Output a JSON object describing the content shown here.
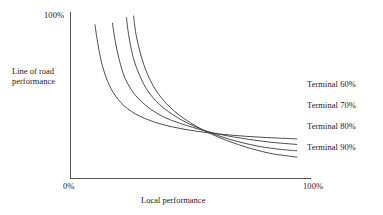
{
  "chart_data": {
    "type": "line",
    "title": "",
    "subtitle": "",
    "xlabel": "Local performance",
    "ylabel": "Line of road performance",
    "xlim": [
      0,
      100
    ],
    "ylim": [
      0,
      100
    ],
    "xticks": [
      "0%",
      "100%"
    ],
    "yticks": [
      "100%"
    ],
    "grid": false,
    "legend_position": "right-inline",
    "annotation": "Four convex trade-off (isoquant) curves: higher terminal performance requires a worse trade-off between local and line-of-road performance.",
    "series": [
      {
        "name": "Terminal 60%",
        "label": "Terminal 60%",
        "color": "#3a3a3a",
        "points": [
          {
            "x": 10.4,
            "y": 97.0
          },
          {
            "x": 11.5,
            "y": 86.0
          },
          {
            "x": 13.0,
            "y": 74.0
          },
          {
            "x": 15.5,
            "y": 62.0
          },
          {
            "x": 19.0,
            "y": 52.0
          },
          {
            "x": 24.0,
            "y": 44.0
          },
          {
            "x": 31.0,
            "y": 38.0
          },
          {
            "x": 40.0,
            "y": 33.5
          },
          {
            "x": 52.0,
            "y": 30.0
          },
          {
            "x": 66.0,
            "y": 27.5
          },
          {
            "x": 80.0,
            "y": 26.0
          },
          {
            "x": 94.5,
            "y": 25.0
          }
        ]
      },
      {
        "name": "Terminal 70%",
        "label": "Terminal 70%",
        "color": "#3a3a3a",
        "points": [
          {
            "x": 17.7,
            "y": 98.0
          },
          {
            "x": 18.8,
            "y": 87.0
          },
          {
            "x": 20.5,
            "y": 75.0
          },
          {
            "x": 23.0,
            "y": 63.0
          },
          {
            "x": 27.0,
            "y": 53.0
          },
          {
            "x": 32.5,
            "y": 45.0
          },
          {
            "x": 39.5,
            "y": 38.5
          },
          {
            "x": 48.5,
            "y": 33.5
          },
          {
            "x": 59.0,
            "y": 29.0
          },
          {
            "x": 71.0,
            "y": 25.5
          },
          {
            "x": 83.0,
            "y": 23.0
          },
          {
            "x": 94.5,
            "y": 21.5
          }
        ]
      },
      {
        "name": "Terminal 80%",
        "label": "Terminal 80%",
        "color": "#3a3a3a",
        "points": [
          {
            "x": 23.5,
            "y": 101.5
          },
          {
            "x": 24.5,
            "y": 90.0
          },
          {
            "x": 26.2,
            "y": 77.0
          },
          {
            "x": 29.0,
            "y": 65.0
          },
          {
            "x": 33.0,
            "y": 54.0
          },
          {
            "x": 39.0,
            "y": 44.5
          },
          {
            "x": 47.0,
            "y": 36.5
          },
          {
            "x": 56.5,
            "y": 30.0
          },
          {
            "x": 67.0,
            "y": 24.5
          },
          {
            "x": 78.0,
            "y": 20.5
          },
          {
            "x": 87.0,
            "y": 18.5
          },
          {
            "x": 94.5,
            "y": 17.5
          }
        ]
      },
      {
        "name": "Terminal 90%",
        "label": "Terminal 90%",
        "color": "#3a3a3a",
        "points": [
          {
            "x": 26.5,
            "y": 102.5
          },
          {
            "x": 27.5,
            "y": 91.0
          },
          {
            "x": 29.5,
            "y": 78.0
          },
          {
            "x": 32.5,
            "y": 65.0
          },
          {
            "x": 37.0,
            "y": 53.0
          },
          {
            "x": 43.5,
            "y": 42.5
          },
          {
            "x": 52.0,
            "y": 33.5
          },
          {
            "x": 62.0,
            "y": 26.0
          },
          {
            "x": 73.0,
            "y": 20.0
          },
          {
            "x": 83.0,
            "y": 16.0
          },
          {
            "x": 89.5,
            "y": 14.5
          },
          {
            "x": 94.5,
            "y": 13.5
          }
        ]
      }
    ]
  },
  "axes": {
    "y_tick_top": "100%",
    "x_tick_left": "0%",
    "x_tick_right": "100%",
    "y_axis_title_line1": "Line of road",
    "y_axis_title_line2": "performance",
    "x_axis_title": "Local performance",
    "axis_color": "#555555"
  },
  "legend": {
    "items": [
      {
        "label": "Terminal 60%"
      },
      {
        "label": "Terminal 70%"
      },
      {
        "label": "Terminal 80%"
      },
      {
        "label": "Terminal 90%"
      }
    ]
  }
}
